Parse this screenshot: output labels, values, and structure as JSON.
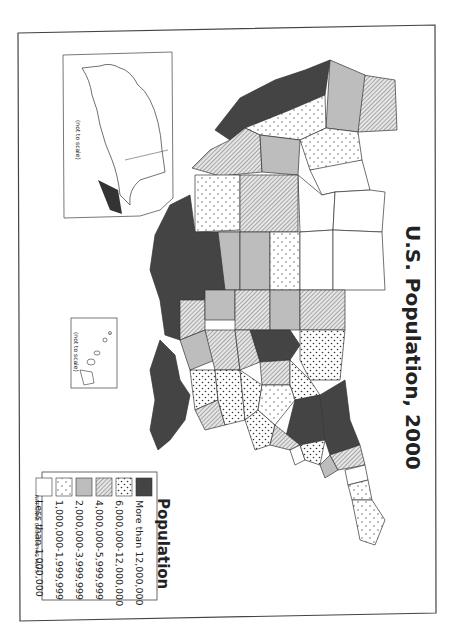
{
  "map": {
    "title": "U.S. Population, 2000",
    "orientation": "rotated 90 degrees counter-clockwise (north points right)",
    "insets": [
      {
        "name": "Alaska",
        "note": "(not to scale)",
        "category": "Less than 1,000,000"
      },
      {
        "name": "Hawaii",
        "note": "(not to scale)",
        "category": "1,000,000-1,999,999"
      }
    ],
    "credit": "NATIONAL GEOGRAPHIC MAPS"
  },
  "legend": {
    "title": "Population",
    "items": [
      {
        "label": "More than 12,000,000",
        "pattern": "solid-dark",
        "color": "#444444"
      },
      {
        "label": "6,000,000-12,000,000",
        "pattern": "dots-dense",
        "color": "#ffffff"
      },
      {
        "label": "4,000,000-5,999,999",
        "pattern": "diagonal-hatch",
        "color": "#bbbbbb"
      },
      {
        "label": "2,000,000-3,999,999",
        "pattern": "solid-light-gray",
        "color": "#bdbdbd"
      },
      {
        "label": "1,000,000-1,999,999",
        "pattern": "dots-sparse",
        "color": "#ffffff"
      },
      {
        "label": "Less than 1,000,000",
        "pattern": "white",
        "color": "#ffffff"
      }
    ]
  },
  "states": {
    "more_than_12m": [
      "California",
      "Texas",
      "Florida",
      "New York",
      "Pennsylvania",
      "Illinois"
    ],
    "6m_to_12m": [
      "Arizona",
      "Ohio",
      "Michigan",
      "New Jersey",
      "Georgia",
      "North Carolina",
      "Virginia"
    ],
    "4m_to_6m": [
      "Washington",
      "Colorado",
      "Minnesota",
      "Missouri",
      "Tennessee",
      "Alabama",
      "Louisiana",
      "Wisconsin",
      "Indiana",
      "Kentucky",
      "South Carolina",
      "Maryland",
      "Massachusetts"
    ],
    "2m_to_4m": [
      "Oregon",
      "Utah",
      "Kansas",
      "Oklahoma",
      "Iowa",
      "Arkansas",
      "Mississippi",
      "Connecticut"
    ],
    "1m_to_2m": [
      "Nevada",
      "Idaho",
      "New Mexico",
      "Nebraska",
      "West Virginia",
      "Maine",
      "New Hampshire",
      "Rhode Island",
      "Hawaii"
    ],
    "less_than_1m": [
      "Montana",
      "Wyoming",
      "North Dakota",
      "South Dakota",
      "Alaska",
      "Vermont",
      "Delaware"
    ]
  }
}
